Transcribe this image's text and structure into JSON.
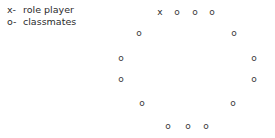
{
  "legend": {
    "rows": [
      {
        "key": "x-",
        "label": "role player"
      },
      {
        "key": "o-",
        "label": "classmates"
      }
    ]
  },
  "diagram": {
    "marker_color": "#3a3a3a",
    "background": "#ffffff",
    "positions": [
      {
        "id": "p1",
        "symbol": "x",
        "type": "role player",
        "x": 160,
        "y": 12
      },
      {
        "id": "p2",
        "symbol": "o",
        "type": "classmates",
        "x": 177,
        "y": 12
      },
      {
        "id": "p3",
        "symbol": "o",
        "type": "classmates",
        "x": 195,
        "y": 12
      },
      {
        "id": "p4",
        "symbol": "o",
        "type": "classmates",
        "x": 212,
        "y": 12
      },
      {
        "id": "p5",
        "symbol": "o",
        "type": "classmates",
        "x": 234,
        "y": 33
      },
      {
        "id": "p6",
        "symbol": "o",
        "type": "classmates",
        "x": 254,
        "y": 58
      },
      {
        "id": "p7",
        "symbol": "o",
        "type": "classmates",
        "x": 254,
        "y": 79
      },
      {
        "id": "p8",
        "symbol": "o",
        "type": "classmates",
        "x": 233,
        "y": 103
      },
      {
        "id": "p9",
        "symbol": "o",
        "type": "classmates",
        "x": 206,
        "y": 126
      },
      {
        "id": "p10",
        "symbol": "o",
        "type": "classmates",
        "x": 188,
        "y": 126
      },
      {
        "id": "p11",
        "symbol": "o",
        "type": "classmates",
        "x": 168,
        "y": 126
      },
      {
        "id": "p12",
        "symbol": "o",
        "type": "classmates",
        "x": 142,
        "y": 103
      },
      {
        "id": "p13",
        "symbol": "o",
        "type": "classmates",
        "x": 121,
        "y": 79
      },
      {
        "id": "p14",
        "symbol": "o",
        "type": "classmates",
        "x": 121,
        "y": 58
      },
      {
        "id": "p15",
        "symbol": "o",
        "type": "classmates",
        "x": 139,
        "y": 33
      }
    ]
  }
}
